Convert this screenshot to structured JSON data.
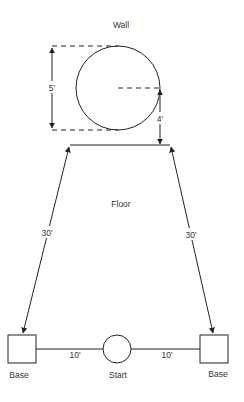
{
  "diagram": {
    "labels": {
      "wall": "Wall",
      "floor": "Floor",
      "start": "Start",
      "base_left": "Base",
      "base_right": "Base"
    },
    "dimensions": {
      "target_height": "5'",
      "target_above_floor": "4'",
      "left_diagonal": "30'",
      "right_diagonal": "30'",
      "left_base_to_start": "10'",
      "right_base_to_start": "10'"
    },
    "colors": {
      "stroke": "#222222",
      "text": "#333333",
      "background": "#ffffff"
    }
  }
}
